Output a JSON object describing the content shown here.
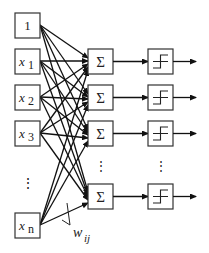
{
  "diagram": {
    "inputs": [
      {
        "label": "1",
        "sub": ""
      },
      {
        "label": "x",
        "sub": "1"
      },
      {
        "label": "x",
        "sub": "2"
      },
      {
        "label": "x",
        "sub": "3"
      },
      {
        "label": "x",
        "sub": "n"
      }
    ],
    "input_ellipsis": "⋮",
    "summation_symbol": "Σ",
    "summation_nodes": 4,
    "activation": "step-function",
    "activation_nodes": 4,
    "node_ellipsis": "⋮",
    "weight_label": {
      "main": "w",
      "sub": "ij"
    },
    "colors": {
      "stroke": "#111111",
      "box": "#333333",
      "background": "#ffffff"
    }
  }
}
